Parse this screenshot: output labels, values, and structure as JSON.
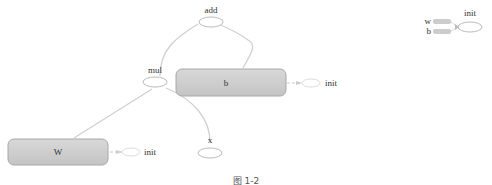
{
  "graph": {
    "nodes": {
      "add": {
        "label": "add",
        "type": "op"
      },
      "mul": {
        "label": "mul",
        "type": "op"
      },
      "b": {
        "label": "b",
        "type": "variable"
      },
      "W": {
        "label": "W",
        "type": "variable"
      },
      "x": {
        "label": "x",
        "type": "placeholder"
      },
      "b_init": {
        "label": "init",
        "type": "init"
      },
      "W_init": {
        "label": "init",
        "type": "init"
      }
    },
    "edges": [
      {
        "from": "mul",
        "to": "add"
      },
      {
        "from": "b",
        "to": "add"
      },
      {
        "from": "W",
        "to": "mul"
      },
      {
        "from": "x",
        "to": "mul"
      },
      {
        "from": "b",
        "to": "b_init",
        "style": "dashed"
      },
      {
        "from": "W",
        "to": "W_init",
        "style": "dashed"
      }
    ]
  },
  "aux_graph": {
    "init_label": "init",
    "inputs": [
      "w",
      "b"
    ]
  },
  "caption": "图 1-2"
}
